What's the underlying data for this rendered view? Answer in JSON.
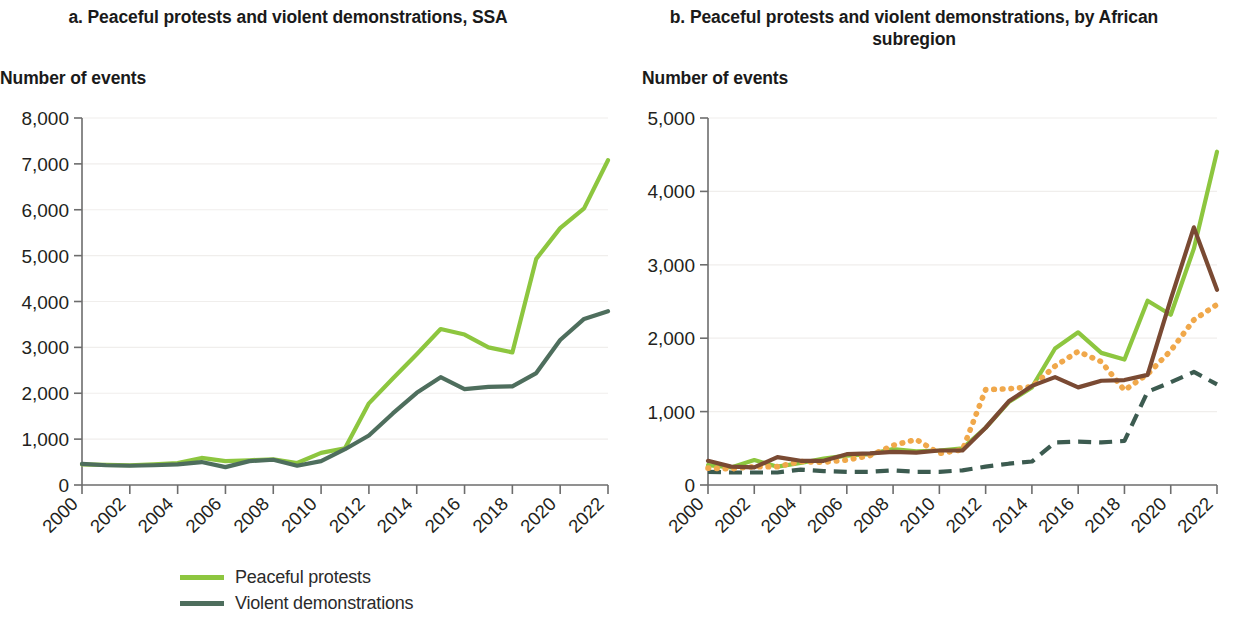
{
  "panels": {
    "a": {
      "title": "a. Peaceful protests and violent demonstrations, SSA",
      "axis_caption": "Number of events"
    },
    "b": {
      "title": "b. Peaceful protests and violent demonstrations, by African subregion",
      "axis_caption": "Number of events"
    }
  },
  "legend": {
    "a": [
      {
        "label": "Peaceful protests",
        "color": "#8DC63F",
        "style": "solid"
      },
      {
        "label": "Violent demonstrations",
        "color": "#4E6E5D",
        "style": "solid"
      }
    ],
    "b": [
      {
        "label": "Eastern Africa",
        "color": "#8DC63F",
        "style": "solid"
      },
      {
        "label": "Middle Africa",
        "color": "#3C5B50",
        "style": "dashed"
      },
      {
        "label": "Southern Africa",
        "color": "#F0A84B",
        "style": "dotted"
      },
      {
        "label": "Western Africa",
        "color": "#7A4A33",
        "style": "solid"
      }
    ]
  },
  "chart_data": [
    {
      "id": "a",
      "type": "line",
      "title": "a. Peaceful protests and violent demonstrations, SSA",
      "xlabel": "",
      "ylabel": "Number of events",
      "xlim": [
        2000,
        2022
      ],
      "ylim": [
        0,
        8000
      ],
      "yticks": [
        0,
        1000,
        2000,
        3000,
        4000,
        5000,
        6000,
        7000,
        8000
      ],
      "ytick_labels": [
        "0",
        "1,000",
        "2,000",
        "3,000",
        "4,000",
        "5,000",
        "6,000",
        "7,000",
        "8,000"
      ],
      "xticks": [
        2000,
        2002,
        2004,
        2006,
        2008,
        2010,
        2012,
        2014,
        2016,
        2018,
        2020,
        2022
      ],
      "xtick_labels": [
        "2000",
        "2002",
        "2004",
        "2006",
        "2008",
        "2010",
        "2012",
        "2014",
        "2016",
        "2018",
        "2020",
        "2022"
      ],
      "grid": "y",
      "legend_position": "bottom",
      "x": [
        2000,
        2001,
        2002,
        2003,
        2004,
        2005,
        2006,
        2007,
        2008,
        2009,
        2010,
        2011,
        2012,
        2013,
        2014,
        2015,
        2016,
        2017,
        2018,
        2019,
        2020,
        2021,
        2022
      ],
      "series": [
        {
          "name": "Peaceful protests",
          "color": "#8DC63F",
          "style": "solid",
          "values": [
            450,
            440,
            430,
            450,
            480,
            590,
            520,
            540,
            560,
            480,
            700,
            800,
            1780,
            2320,
            2850,
            3400,
            3280,
            3000,
            2890,
            4930,
            5600,
            6030,
            7080
          ]
        },
        {
          "name": "Violent demonstrations",
          "color": "#4E6E5D",
          "style": "solid",
          "values": [
            460,
            430,
            420,
            430,
            450,
            500,
            390,
            520,
            550,
            420,
            520,
            780,
            1080,
            1560,
            2010,
            2350,
            2090,
            2140,
            2150,
            2440,
            3160,
            3620,
            3790
          ]
        }
      ]
    },
    {
      "id": "b",
      "type": "line",
      "title": "b. Peaceful protests and violent demonstrations, by African subregion",
      "xlabel": "",
      "ylabel": "Number of events",
      "xlim": [
        2000,
        2022
      ],
      "ylim": [
        0,
        5000
      ],
      "yticks": [
        0,
        1000,
        2000,
        3000,
        4000,
        5000
      ],
      "ytick_labels": [
        "0",
        "1,000",
        "2,000",
        "3,000",
        "4,000",
        "5,000"
      ],
      "xticks": [
        2000,
        2002,
        2004,
        2006,
        2008,
        2010,
        2012,
        2014,
        2016,
        2018,
        2020,
        2022
      ],
      "xtick_labels": [
        "2000",
        "2002",
        "2004",
        "2006",
        "2008",
        "2010",
        "2012",
        "2014",
        "2016",
        "2018",
        "2020",
        "2022"
      ],
      "grid": "y",
      "legend_position": "bottom",
      "x": [
        2000,
        2001,
        2002,
        2003,
        2004,
        2005,
        2006,
        2007,
        2008,
        2009,
        2010,
        2011,
        2012,
        2013,
        2014,
        2015,
        2016,
        2017,
        2018,
        2019,
        2020,
        2021,
        2022
      ],
      "series": [
        {
          "name": "Eastern Africa",
          "color": "#8DC63F",
          "style": "solid",
          "values": [
            270,
            240,
            340,
            250,
            300,
            360,
            400,
            420,
            490,
            460,
            470,
            500,
            780,
            1130,
            1330,
            1860,
            2080,
            1800,
            1710,
            2510,
            2320,
            3220,
            4540
          ]
        },
        {
          "name": "Middle Africa",
          "color": "#3C5B50",
          "style": "dashed",
          "values": [
            180,
            170,
            170,
            170,
            210,
            190,
            180,
            180,
            200,
            180,
            180,
            200,
            250,
            290,
            320,
            580,
            590,
            580,
            600,
            1270,
            1400,
            1540,
            1370
          ]
        },
        {
          "name": "Southern Africa",
          "color": "#F0A84B",
          "style": "dotted",
          "values": [
            230,
            220,
            250,
            250,
            320,
            310,
            340,
            400,
            540,
            620,
            430,
            480,
            1300,
            1310,
            1340,
            1620,
            1820,
            1680,
            1290,
            1510,
            1830,
            2250,
            2460
          ]
        },
        {
          "name": "Western Africa",
          "color": "#7A4A33",
          "style": "solid",
          "values": [
            330,
            250,
            240,
            380,
            330,
            330,
            420,
            430,
            450,
            440,
            470,
            470,
            780,
            1140,
            1350,
            1470,
            1330,
            1420,
            1430,
            1500,
            2530,
            3510,
            2660
          ]
        }
      ]
    }
  ]
}
